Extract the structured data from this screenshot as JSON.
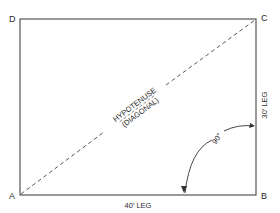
{
  "diagram": {
    "corners": {
      "a": "A",
      "b": "B",
      "c": "C",
      "d": "D"
    },
    "diagonal_label_line1": "HYPOTENUSE",
    "diagonal_label_line2": "(DIAGONAL)",
    "bottom_leg_label": "40′ LEG",
    "right_leg_label": "30′ LEG",
    "angle_label": "90°",
    "colors": {
      "line": "#555555",
      "text": "#2a2a2a"
    }
  }
}
